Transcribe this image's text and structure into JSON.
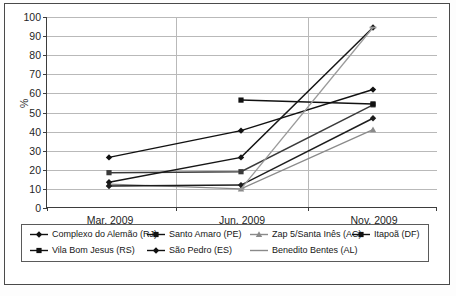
{
  "chart_data": {
    "type": "line",
    "title": "",
    "subtitle": "",
    "xlabel": "",
    "ylabel": "%",
    "categories": [
      "Mar. 2009",
      "Jun. 2009",
      "Nov. 2009"
    ],
    "ylim": [
      0,
      100
    ],
    "yticks": [
      0,
      10,
      20,
      30,
      40,
      50,
      60,
      70,
      80,
      90,
      100
    ],
    "grid": true,
    "legend_position": "bottom",
    "series": [
      {
        "name": "Complexo do Alemão (RJ)",
        "marker": "diamond",
        "color": "#111111",
        "values": [
          26.5,
          40.5,
          62.0
        ]
      },
      {
        "name": "Santo Amaro (PE)",
        "marker": "square",
        "color": "#3a3a3a",
        "values": [
          18.5,
          19.0,
          54.0
        ]
      },
      {
        "name": "Zap 5/Santa Inês (AC)",
        "marker": "triangle",
        "color": "#8a8a8a",
        "values": [
          12.5,
          10.0,
          41.0
        ]
      },
      {
        "name": "Itapoã (DF)",
        "marker": "square",
        "color": "#111111",
        "values": [
          null,
          56.5,
          54.5
        ]
      },
      {
        "name": "Vila Bom Jesus (RS)",
        "marker": "diamond",
        "color": "#161616",
        "values": [
          13.5,
          26.5,
          94.5
        ]
      },
      {
        "name": "São Pedro (ES)",
        "marker": "diamond",
        "color": "#1d1d1d",
        "values": [
          11.5,
          12.0,
          47.0
        ]
      },
      {
        "name": "Benedito Bentes (AL)",
        "marker": "dash",
        "color": "#9a9a9a",
        "values": [
          null,
          10.0,
          94.5
        ]
      }
    ]
  },
  "axis": {
    "y_label": "%",
    "y_ticks": [
      "100",
      "90",
      "80",
      "70",
      "60",
      "50",
      "40",
      "30",
      "20",
      "10",
      "0"
    ],
    "x_ticks": [
      "Mar. 2009",
      "Jun. 2009",
      "Nov. 2009"
    ]
  },
  "legend": {
    "row1": [
      {
        "label": "Complexo do Alemão (RJ)",
        "marker": "diamond"
      },
      {
        "label": "Santo Amaro (PE)",
        "marker": "square"
      },
      {
        "label": "Zap 5/Santa Inês (AC)",
        "marker": "triangle"
      },
      {
        "label": "Itapoã (DF)",
        "marker": "square-bold"
      }
    ],
    "row2": [
      {
        "label": "Vila Bom Jesus (RS)",
        "marker": "square-bold"
      },
      {
        "label": "São Pedro (ES)",
        "marker": "diamond"
      },
      {
        "label": "Benedito Bentes (AL)",
        "marker": "dash"
      }
    ]
  },
  "caption": ""
}
